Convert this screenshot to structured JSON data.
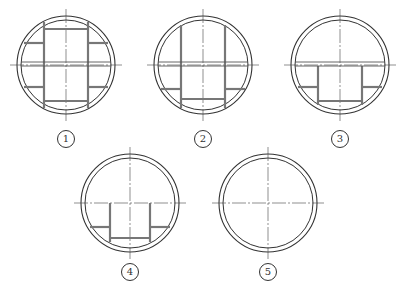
{
  "figure": {
    "colors": {
      "line": "#333333",
      "member": "#777777"
    },
    "sections": [
      {
        "id": "1",
        "label": "1",
        "cx": 66,
        "cy": 65,
        "label_y": 139
      },
      {
        "id": "2",
        "label": "2",
        "cx": 203,
        "cy": 65,
        "label_y": 139
      },
      {
        "id": "3",
        "label": "3",
        "cx": 340,
        "cy": 65,
        "label_y": 139
      },
      {
        "id": "4",
        "label": "4",
        "cx": 130,
        "cy": 203,
        "label_y": 272
      },
      {
        "id": "5",
        "label": "5",
        "cx": 268,
        "cy": 203,
        "label_y": 272
      }
    ]
  }
}
